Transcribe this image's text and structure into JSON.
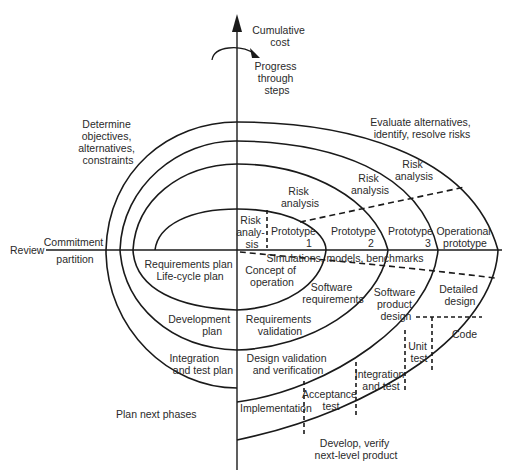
{
  "diagram": {
    "axes": {
      "vertical_label": [
        "Cumulative",
        "cost"
      ],
      "rotation_label": [
        "Progress",
        "through",
        "steps"
      ],
      "horizontal_left_label": "Review",
      "commitment_label": [
        "Commitment",
        "partition"
      ]
    },
    "quadrants": {
      "top_left": [
        "Determine",
        "objectives,",
        "alternatives,",
        "constraints"
      ],
      "top_right": [
        "Evaluate alternatives,",
        "identify, resolve risks"
      ],
      "bottom_left": "Plan next phases",
      "bottom_right": [
        "Develop, verify",
        "next-level product"
      ]
    },
    "risk_analysis": {
      "r1": [
        "Risk",
        "analy-",
        "sis"
      ],
      "r2": [
        "Risk",
        "analysis"
      ],
      "r3": [
        "Risk",
        "analysis"
      ],
      "r4": [
        "Risk",
        "analysis"
      ]
    },
    "prototypes": {
      "p1": [
        "Prototype",
        "1"
      ],
      "p2": [
        "Prototype",
        "2"
      ],
      "p3": [
        "Prototype",
        "3"
      ],
      "operational": [
        "Operational",
        "prototype"
      ]
    },
    "simulations": "Simulations, models, benchmarks",
    "plans": {
      "requirements": [
        "Requirements plan",
        "Life-cycle plan"
      ],
      "development": [
        "Development",
        "plan"
      ],
      "integration": [
        "Integration",
        "and test plan"
      ]
    },
    "develop": {
      "concept": [
        "Concept of",
        "operation"
      ],
      "software_requirements": [
        "Software",
        "requirements"
      ],
      "requirements_validation": [
        "Requirements",
        "validation"
      ],
      "product_design": [
        "Software",
        "product",
        "design"
      ],
      "design_validation": [
        "Design validation",
        "and verification"
      ],
      "detailed_design": [
        "Detailed",
        "design"
      ],
      "code": "Code",
      "unit_test": [
        "Unit",
        "test"
      ],
      "integration_test": [
        "Integration",
        "and test"
      ],
      "acceptance_test": [
        "Acceptance",
        "test"
      ],
      "implementation": "Implementation"
    }
  }
}
